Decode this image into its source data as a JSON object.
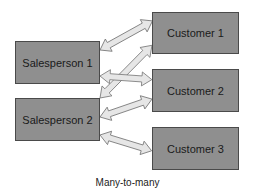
{
  "diagram": {
    "caption": "Many-to-many",
    "colors": {
      "box_fill": "#8f8f8f",
      "box_border": "#4a4a4a",
      "arrow_fill": "#e6e6e6",
      "arrow_stroke": "#777777"
    },
    "left_entities": [
      {
        "id": "sp1",
        "label": "Salesperson 1"
      },
      {
        "id": "sp2",
        "label": "Salesperson 2"
      }
    ],
    "right_entities": [
      {
        "id": "c1",
        "label": "Customer 1"
      },
      {
        "id": "c2",
        "label": "Customer 2"
      },
      {
        "id": "c3",
        "label": "Customer 3"
      }
    ],
    "relationships": [
      {
        "from": "Salesperson 1",
        "to": "Customer 1",
        "type": "bidirectional"
      },
      {
        "from": "Salesperson 1",
        "to": "Customer 2",
        "type": "bidirectional"
      },
      {
        "from": "Salesperson 2",
        "to": "Customer 1",
        "type": "bidirectional"
      },
      {
        "from": "Salesperson 2",
        "to": "Customer 2",
        "type": "bidirectional"
      },
      {
        "from": "Salesperson 2",
        "to": "Customer 3",
        "type": "bidirectional"
      }
    ]
  }
}
